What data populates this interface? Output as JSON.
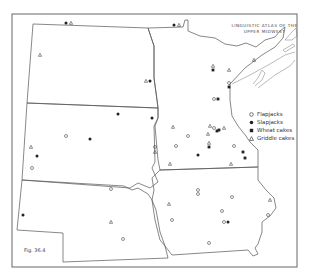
{
  "title": {
    "line1": "Linguistic Atlas of the",
    "line2": "Upper Midwest"
  },
  "figure_label": "Fig. 36.4",
  "legend": {
    "items": [
      {
        "symbol": "open-circle",
        "label": "Flapjacks"
      },
      {
        "symbol": "filled-circle",
        "label": "Slapjacks"
      },
      {
        "symbol": "filled-square",
        "label": "Wheat cakes"
      },
      {
        "symbol": "open-triangle",
        "label": "Griddle cakes"
      }
    ]
  },
  "colors": {
    "border": "#555555",
    "frame": "#666666",
    "marker": "#222222",
    "background": "#ffffff"
  },
  "states": [
    "North Dakota",
    "South Dakota",
    "Nebraska",
    "Minnesota",
    "Iowa"
  ],
  "markers": [
    {
      "type": "filled-circle",
      "x": 66,
      "y": 23
    },
    {
      "type": "open-triangle",
      "x": 71,
      "y": 23
    },
    {
      "type": "filled-circle",
      "x": 174,
      "y": 25
    },
    {
      "type": "open-triangle",
      "x": 179,
      "y": 25
    },
    {
      "type": "open-triangle",
      "x": 40,
      "y": 55
    },
    {
      "type": "open-triangle",
      "x": 146,
      "y": 81
    },
    {
      "type": "filled-circle",
      "x": 150,
      "y": 81
    },
    {
      "type": "open-triangle",
      "x": 213,
      "y": 66
    },
    {
      "type": "filled-square",
      "x": 213,
      "y": 70
    },
    {
      "type": "open-triangle",
      "x": 229,
      "y": 70
    },
    {
      "type": "open-triangle",
      "x": 254,
      "y": 60
    },
    {
      "type": "open-circle",
      "x": 229,
      "y": 83
    },
    {
      "type": "filled-square",
      "x": 229,
      "y": 87
    },
    {
      "type": "open-circle",
      "x": 214,
      "y": 99
    },
    {
      "type": "filled-square",
      "x": 218,
      "y": 99
    },
    {
      "type": "filled-circle",
      "x": 118,
      "y": 114
    },
    {
      "type": "filled-circle",
      "x": 152,
      "y": 118
    },
    {
      "type": "filled-circle",
      "x": 90,
      "y": 139
    },
    {
      "type": "open-circle",
      "x": 66,
      "y": 136
    },
    {
      "type": "open-circle",
      "x": 155,
      "y": 147
    },
    {
      "type": "open-triangle",
      "x": 155,
      "y": 152
    },
    {
      "type": "open-triangle",
      "x": 173,
      "y": 127
    },
    {
      "type": "open-circle",
      "x": 188,
      "y": 136
    },
    {
      "type": "open-triangle",
      "x": 210,
      "y": 126
    },
    {
      "type": "open-triangle",
      "x": 208,
      "y": 134
    },
    {
      "type": "open-circle",
      "x": 214,
      "y": 128
    },
    {
      "type": "filled-square",
      "x": 217,
      "y": 131
    },
    {
      "type": "filled-square",
      "x": 219,
      "y": 130
    },
    {
      "type": "open-triangle",
      "x": 224,
      "y": 128
    },
    {
      "type": "open-circle",
      "x": 176,
      "y": 146
    },
    {
      "type": "open-triangle",
      "x": 209,
      "y": 143
    },
    {
      "type": "filled-square",
      "x": 209,
      "y": 147
    },
    {
      "type": "filled-circle",
      "x": 198,
      "y": 155
    },
    {
      "type": "open-circle",
      "x": 234,
      "y": 146
    },
    {
      "type": "filled-square",
      "x": 243,
      "y": 152
    },
    {
      "type": "filled-square",
      "x": 245,
      "y": 158
    },
    {
      "type": "open-triangle",
      "x": 170,
      "y": 164
    },
    {
      "type": "open-triangle",
      "x": 231,
      "y": 164
    },
    {
      "type": "open-triangle",
      "x": 31,
      "y": 147
    },
    {
      "type": "filled-circle",
      "x": 37,
      "y": 156
    },
    {
      "type": "open-circle",
      "x": 32,
      "y": 168
    },
    {
      "type": "open-circle",
      "x": 111,
      "y": 189
    },
    {
      "type": "filled-circle",
      "x": 23,
      "y": 215
    },
    {
      "type": "open-triangle",
      "x": 111,
      "y": 222
    },
    {
      "type": "open-circle",
      "x": 123,
      "y": 239
    },
    {
      "type": "open-circle",
      "x": 198,
      "y": 190
    },
    {
      "type": "open-circle",
      "x": 198,
      "y": 194
    },
    {
      "type": "open-circle",
      "x": 232,
      "y": 197
    },
    {
      "type": "open-triangle",
      "x": 169,
      "y": 204
    },
    {
      "type": "open-circle",
      "x": 172,
      "y": 220
    },
    {
      "type": "open-circle",
      "x": 222,
      "y": 211
    },
    {
      "type": "open-circle",
      "x": 224,
      "y": 222
    },
    {
      "type": "filled-circle",
      "x": 228,
      "y": 222
    },
    {
      "type": "open-triangle",
      "x": 270,
      "y": 200
    },
    {
      "type": "open-circle",
      "x": 268,
      "y": 215
    },
    {
      "type": "open-circle",
      "x": 209,
      "y": 243
    }
  ]
}
